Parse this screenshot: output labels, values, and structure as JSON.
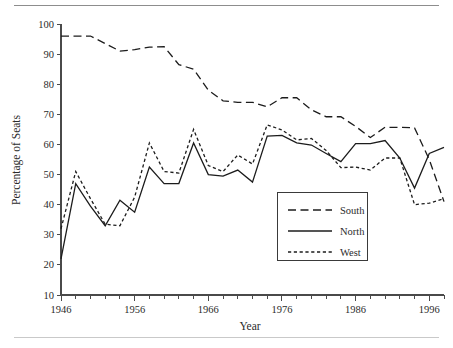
{
  "chart_data": {
    "type": "line",
    "title": "",
    "xlabel": "Year",
    "ylabel": "Percentage of Seats",
    "xlim": [
      1946,
      1998
    ],
    "ylim": [
      10,
      100
    ],
    "ytick_labels": [
      "10",
      "20",
      "30",
      "40",
      "50",
      "60",
      "70",
      "80",
      "90",
      "100"
    ],
    "ytick_values": [
      10,
      20,
      30,
      40,
      50,
      60,
      70,
      80,
      90,
      100
    ],
    "xtick_labels": [
      "1946",
      "1956",
      "1966",
      "1976",
      "1986",
      "1996"
    ],
    "xtick_values": [
      1946,
      1956,
      1966,
      1976,
      1986,
      1996
    ],
    "xminor_step": 2,
    "grid": false,
    "legend_position": "center-right",
    "x": [
      1946,
      1948,
      1950,
      1952,
      1954,
      1956,
      1958,
      1960,
      1962,
      1964,
      1966,
      1968,
      1970,
      1972,
      1974,
      1976,
      1978,
      1980,
      1982,
      1984,
      1986,
      1988,
      1990,
      1992,
      1994,
      1996,
      1998
    ],
    "series": [
      {
        "name": "South",
        "dash": "long-dash",
        "values": [
          96,
          96,
          96,
          93.5,
          91,
          91.5,
          92.3,
          92.5,
          86.5,
          85,
          78,
          74.5,
          74,
          74,
          72.5,
          75.5,
          75.5,
          71.5,
          69.2,
          69.2,
          66,
          62.3,
          65.7,
          65.7,
          65.5,
          55,
          41
        ]
      },
      {
        "name": "North",
        "dash": "solid",
        "values": [
          22,
          47,
          39.5,
          33,
          41.5,
          37.5,
          52.5,
          47,
          47,
          60.5,
          50,
          49.5,
          51.5,
          47.5,
          62.8,
          63,
          60.5,
          59.8,
          57,
          54.3,
          60.3,
          60.3,
          61.3,
          55.5,
          45.5,
          57,
          59
        ]
      },
      {
        "name": "West",
        "dash": "short-dash",
        "values": [
          32,
          51,
          42,
          33.5,
          33,
          42.5,
          60.5,
          51,
          50.5,
          65,
          53,
          51,
          56.5,
          53.5,
          66.5,
          64.8,
          61.5,
          62,
          58,
          52.3,
          52.5,
          51.5,
          55.5,
          55.5,
          40,
          40.5,
          42
        ]
      }
    ]
  },
  "legend": {
    "entries": [
      {
        "label": "South"
      },
      {
        "label": "North"
      },
      {
        "label": "West"
      }
    ]
  }
}
